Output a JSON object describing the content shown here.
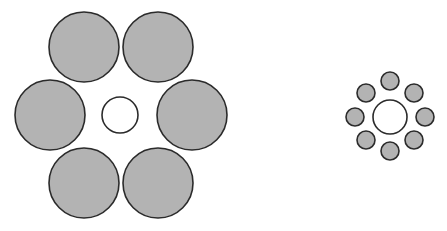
{
  "diagram": {
    "title": "",
    "colors": {
      "fill": "#b3b3b3",
      "stroke": "#2b2b2b",
      "center_fill": "#ffffff"
    },
    "left_group": {
      "center": {
        "cx": 120,
        "cy": 115,
        "r": 18
      },
      "surround_r": 35,
      "surround": [
        {
          "cx": 84,
          "cy": 47
        },
        {
          "cx": 158,
          "cy": 47
        },
        {
          "cx": 50,
          "cy": 115
        },
        {
          "cx": 192,
          "cy": 115
        },
        {
          "cx": 84,
          "cy": 183
        },
        {
          "cx": 158,
          "cy": 183
        }
      ]
    },
    "right_group": {
      "center": {
        "cx": 390,
        "cy": 117,
        "r": 17
      },
      "surround_r": 9,
      "surround": [
        {
          "cx": 390,
          "cy": 81
        },
        {
          "cx": 414,
          "cy": 93
        },
        {
          "cx": 425,
          "cy": 117
        },
        {
          "cx": 414,
          "cy": 140
        },
        {
          "cx": 390,
          "cy": 151
        },
        {
          "cx": 366,
          "cy": 140
        },
        {
          "cx": 355,
          "cy": 117
        },
        {
          "cx": 366,
          "cy": 93
        }
      ]
    }
  }
}
